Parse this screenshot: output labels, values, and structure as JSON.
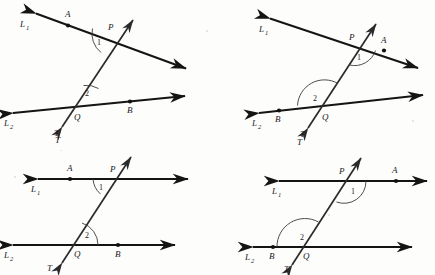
{
  "figure": {
    "background_color": "#fdfdfc",
    "line_color": "#141414",
    "arc_color": "#3a3a3a",
    "panel_count": 4
  },
  "labels": {
    "line1": "L",
    "line1_sub": "1",
    "line2": "L",
    "line2_sub": "2",
    "transversal": "T",
    "point_p": "P",
    "point_q": "Q",
    "point_a": "A",
    "point_b": "B",
    "angle1": "1",
    "angle2": "2"
  },
  "panels": [
    {
      "id": "panel-top-left",
      "name": "slanted-lines-A-left-B-right",
      "line1_orientation": "slanted-down-right",
      "line2_orientation": "slanted-up-right",
      "transversal_orientation": "slanted-up-right",
      "point_a_side": "left-of-P",
      "point_b_side": "right-of-Q",
      "angle1_position": "below-left-of-P",
      "angle2_position": "above-right-of-Q",
      "parallel": false
    },
    {
      "id": "panel-top-right",
      "name": "slanted-lines-A-right-B-left",
      "line1_orientation": "slanted-down-right",
      "line2_orientation": "slanted-up-right",
      "transversal_orientation": "slanted-up-right",
      "point_a_side": "right-of-P",
      "point_b_side": "left-of-Q",
      "angle1_position": "below-right-of-P",
      "angle2_position": "above-left-of-Q",
      "parallel": false
    },
    {
      "id": "panel-bottom-left",
      "name": "horizontal-parallels-A-left-B-right",
      "line1_orientation": "horizontal",
      "line2_orientation": "horizontal",
      "transversal_orientation": "slanted-up-right",
      "point_a_side": "left-of-P",
      "point_b_side": "right-of-Q",
      "angle1_position": "below-left-of-P",
      "angle2_position": "above-right-of-Q",
      "parallel": true
    },
    {
      "id": "panel-bottom-right",
      "name": "horizontal-parallels-A-right-B-left",
      "line1_orientation": "horizontal",
      "line2_orientation": "horizontal",
      "transversal_orientation": "slanted-up-right",
      "point_a_side": "right-of-P",
      "point_b_side": "left-of-Q",
      "angle1_position": "below-right-of-P",
      "angle2_position": "above-left-of-Q",
      "parallel": true
    }
  ]
}
